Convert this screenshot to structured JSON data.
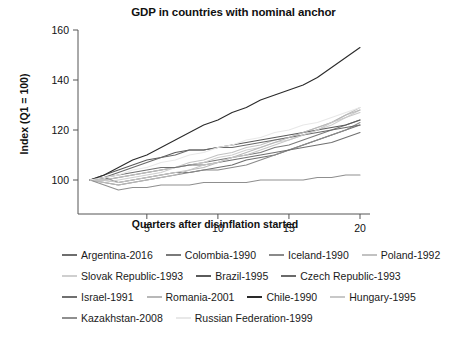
{
  "chart_data": {
    "type": "line",
    "title": "GDP in countries with nominal anchor",
    "xlabel": "Quarters after disinflation started",
    "ylabel": "Index (Q1 = 100)",
    "xlim": [
      1,
      20
    ],
    "ylim": [
      92,
      162
    ],
    "xticks": [
      5,
      10,
      15,
      20
    ],
    "yticks": [
      100,
      120,
      140,
      160
    ],
    "grid": false,
    "legend_position": "below",
    "x": [
      1,
      2,
      3,
      4,
      5,
      6,
      7,
      8,
      9,
      10,
      11,
      12,
      13,
      14,
      15,
      16,
      17,
      18,
      19,
      20
    ],
    "series": [
      {
        "name": "Argentina-2016",
        "color": "#6e6e6e",
        "values": [
          100,
          101,
          99,
          100,
          101,
          102,
          103,
          103,
          104,
          105,
          106,
          108,
          109,
          110,
          112,
          114,
          116,
          118,
          120,
          122
        ]
      },
      {
        "name": "Colombia-1990",
        "color": "#7a7a7a",
        "values": [
          100,
          100,
          101,
          102,
          103,
          104,
          105,
          106,
          107,
          108,
          109,
          110,
          111,
          113,
          114,
          116,
          118,
          120,
          122,
          124
        ]
      },
      {
        "name": "Iceland-1990",
        "color": "#8a8a8a",
        "values": [
          100,
          99,
          98,
          99,
          100,
          101,
          102,
          103,
          104,
          104,
          105,
          106,
          108,
          110,
          112,
          114,
          116,
          118,
          120,
          123
        ]
      },
      {
        "name": "Poland-1992",
        "color": "#c2c2c2",
        "values": [
          100,
          100,
          101,
          102,
          103,
          104,
          105,
          107,
          108,
          110,
          111,
          113,
          114,
          116,
          117,
          119,
          121,
          123,
          126,
          129
        ]
      },
      {
        "name": "Slovak Republic-1993",
        "color": "#cfcfcf",
        "values": [
          100,
          99,
          100,
          101,
          102,
          103,
          105,
          106,
          107,
          109,
          110,
          112,
          113,
          115,
          116,
          118,
          120,
          122,
          125,
          128
        ]
      },
      {
        "name": "Brazil-1995",
        "color": "#5a5a5a",
        "values": [
          100,
          102,
          104,
          106,
          108,
          109,
          111,
          112,
          112,
          113,
          114,
          115,
          116,
          117,
          118,
          119,
          120,
          121,
          122,
          124
        ]
      },
      {
        "name": "Czech Republic-1993",
        "color": "#6a6a6a",
        "values": [
          100,
          101,
          103,
          105,
          107,
          109,
          110,
          112,
          112,
          113,
          113,
          114,
          115,
          116,
          117,
          118,
          119,
          120,
          121,
          122
        ]
      },
      {
        "name": "Israel-1991",
        "color": "#707070",
        "values": [
          100,
          101,
          102,
          103,
          104,
          105,
          105,
          106,
          106,
          107,
          108,
          109,
          110,
          111,
          112,
          113,
          114,
          115,
          117,
          119
        ]
      },
      {
        "name": "Romania-2001",
        "color": "#b8b8b8",
        "values": [
          100,
          99,
          98,
          99,
          100,
          101,
          102,
          104,
          105,
          107,
          109,
          111,
          113,
          115,
          117,
          119,
          121,
          123,
          126,
          128
        ]
      },
      {
        "name": "Chile-1990",
        "color": "#2a2a2a",
        "values": [
          100,
          102,
          105,
          108,
          110,
          113,
          116,
          119,
          122,
          124,
          127,
          129,
          132,
          134,
          136,
          138,
          141,
          145,
          149,
          153
        ]
      },
      {
        "name": "Hungary-1995",
        "color": "#c8c8c8",
        "values": [
          100,
          100,
          99,
          100,
          101,
          102,
          103,
          104,
          106,
          107,
          109,
          110,
          112,
          114,
          116,
          118,
          120,
          123,
          125,
          127
        ]
      },
      {
        "name": "Kazakhstan-2008",
        "color": "#8f8f8f",
        "values": [
          100,
          98,
          96,
          97,
          97,
          98,
          98,
          98,
          99,
          99,
          99,
          99,
          100,
          100,
          100,
          100,
          101,
          101,
          102,
          102
        ]
      },
      {
        "name": "Russian Federation-1999",
        "color": "#e8e8e8",
        "values": [
          100,
          101,
          102,
          104,
          105,
          107,
          108,
          110,
          111,
          113,
          114,
          116,
          117,
          119,
          120,
          122,
          123,
          125,
          127,
          129
        ]
      }
    ]
  },
  "legend_rows": [
    [
      "Argentina-2016",
      "Colombia-1990",
      "Iceland-1990",
      "Poland-1992"
    ],
    [
      "Slovak Republic-1993",
      "Brazil-1995",
      "Czech Republic-1993"
    ],
    [
      "Israel-1991",
      "Romania-2001",
      "Chile-1990",
      "Hungary-1995"
    ],
    [
      "Kazakhstan-2008",
      "Russian Federation-1999"
    ]
  ]
}
